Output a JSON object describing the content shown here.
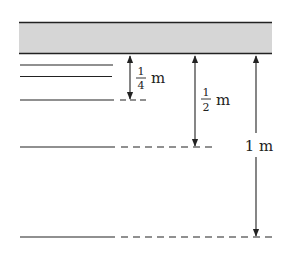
{
  "diagram": {
    "ceiling_fill": "#d6d6d6",
    "stroke_color": "#222222",
    "labels": {
      "quarter_num": "1",
      "quarter_den": "4",
      "quarter_unit": "m",
      "half_num": "1",
      "half_den": "2",
      "half_unit": "m",
      "full": "1 m"
    },
    "levels": [
      {
        "name": "short-line-1",
        "y": 65
      },
      {
        "name": "short-line-2",
        "y": 76
      },
      {
        "name": "quarter-level",
        "y": 100
      },
      {
        "name": "half-level",
        "y": 147
      },
      {
        "name": "full-level",
        "y": 237
      }
    ]
  }
}
